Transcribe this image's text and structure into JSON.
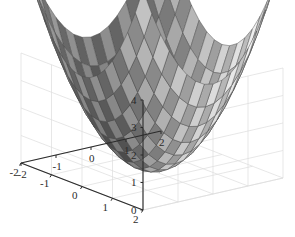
{
  "figure": {
    "type": "surface-plot-3d",
    "background_color": "#ffffff",
    "axis_color": "#2b2b2b",
    "grid_color": "#dcdcdc",
    "mesh_line_color": "#4a4a4a",
    "width": 295,
    "height": 237
  },
  "chart_data": {
    "type": "surface",
    "title": "",
    "subtitle": "",
    "xlabel": "",
    "ylabel": "",
    "zlabel": "",
    "colormap": "gray",
    "shading": "faceted",
    "projection": "3d-orthographic",
    "view": {
      "azimuth": -37.5,
      "elevation": 30
    },
    "grid": true,
    "legend": null,
    "legend_position": "none",
    "xlim": [
      -2,
      2
    ],
    "ylim": [
      -2,
      2
    ],
    "zlim": [
      0,
      4
    ],
    "xticks": [
      -2,
      -1,
      0,
      1,
      2
    ],
    "yticks": [
      -2,
      -1,
      0,
      1,
      2
    ],
    "zticks": [
      0,
      1,
      2,
      3,
      4
    ],
    "xtick_labels": [
      "-2",
      "-1",
      "0",
      "1",
      "2"
    ],
    "ytick_labels": [
      "2",
      "1",
      "0",
      "-1",
      "-2"
    ],
    "ztick_labels": [
      "0",
      "1",
      "2",
      "3",
      "4"
    ],
    "surface_function": "z = x^2 + y^2 over x,y in [-2,2]",
    "grid_resolution": {
      "nx": 17,
      "ny": 17
    },
    "x": [
      -2,
      -1.75,
      -1.5,
      -1.25,
      -1,
      -0.75,
      -0.5,
      -0.25,
      0,
      0.25,
      0.5,
      0.75,
      1,
      1.25,
      1.5,
      1.75,
      2
    ],
    "y": [
      -2,
      -1.75,
      -1.5,
      -1.25,
      -1,
      -0.75,
      -0.5,
      -0.25,
      0,
      0.25,
      0.5,
      0.75,
      1,
      1.25,
      1.5,
      1.75,
      2
    ],
    "z_min": 0,
    "z_max": 4,
    "z_corner_values": [
      4,
      4,
      4,
      4
    ],
    "z_center_value": 0,
    "annotations": []
  },
  "axes": {
    "z_ticks": [
      {
        "label": "4",
        "value": 4
      },
      {
        "label": "3",
        "value": 3
      },
      {
        "label": "2",
        "value": 2
      },
      {
        "label": "1",
        "value": 1
      },
      {
        "label": "0",
        "value": 0
      }
    ],
    "y_ticks": [
      {
        "label": "2",
        "value": 2
      },
      {
        "label": "1",
        "value": 1
      },
      {
        "label": "0",
        "value": 0
      },
      {
        "label": "-1",
        "value": -1
      },
      {
        "label": "-2",
        "value": -2
      }
    ],
    "x_ticks": [
      {
        "label": "-2",
        "value": -2
      },
      {
        "label": "-1",
        "value": -1
      },
      {
        "label": "0",
        "value": 0
      },
      {
        "label": "1",
        "value": 1
      },
      {
        "label": "2",
        "value": 2
      }
    ]
  }
}
